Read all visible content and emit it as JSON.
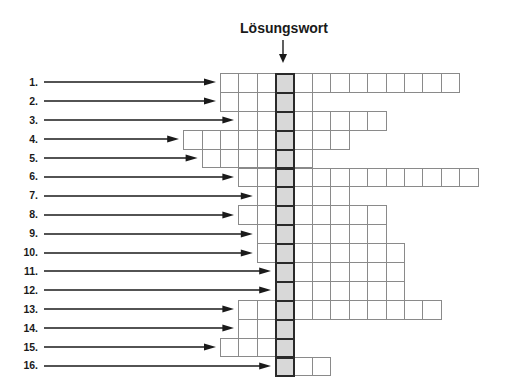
{
  "title": "Lösungswort",
  "grid": {
    "solution_column": 3,
    "origin_x": 220,
    "origin_y": 73,
    "cell_width": 18.4,
    "cell_height": 18.9,
    "colors": {
      "cell_fill": "#ffffff",
      "cell_border": "#8a8a8a",
      "solution_fill": "#d8d8d8",
      "solution_border": "#2a2a2a"
    }
  },
  "rows": [
    {
      "label": "1.",
      "start_col": 0,
      "end_col": 12
    },
    {
      "label": "2.",
      "start_col": 0,
      "end_col": 4
    },
    {
      "label": "3.",
      "start_col": 1,
      "end_col": 8
    },
    {
      "label": "4.",
      "start_col": -2,
      "end_col": 6
    },
    {
      "label": "5.",
      "start_col": -1,
      "end_col": 4
    },
    {
      "label": "6.",
      "start_col": 1,
      "end_col": 13
    },
    {
      "label": "7.",
      "start_col": 2,
      "end_col": 6
    },
    {
      "label": "8.",
      "start_col": 1,
      "end_col": 8
    },
    {
      "label": "9.",
      "start_col": 2,
      "end_col": 8
    },
    {
      "label": "10.",
      "start_col": 2,
      "end_col": 9
    },
    {
      "label": "11.",
      "start_col": 3,
      "end_col": 9
    },
    {
      "label": "12.",
      "start_col": 3,
      "end_col": 9
    },
    {
      "label": "13.",
      "start_col": 1,
      "end_col": 11
    },
    {
      "label": "14.",
      "start_col": 1,
      "end_col": 3
    },
    {
      "label": "15.",
      "start_col": 0,
      "end_col": 3
    },
    {
      "label": "16.",
      "start_col": 3,
      "end_col": 5
    }
  ]
}
